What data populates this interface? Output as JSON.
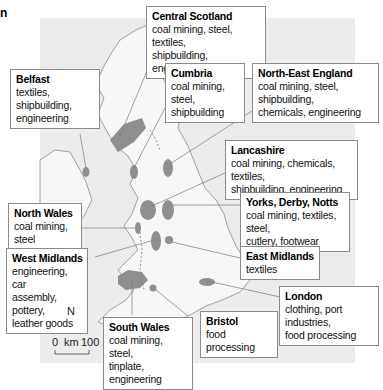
{
  "corner_text": "n",
  "regions": [
    {
      "id": "central-scotland",
      "title": "Central Scotland",
      "lines": [
        "coal mining, steel, textiles,",
        "shipbuilding, engineering"
      ]
    },
    {
      "id": "belfast",
      "title": "Belfast",
      "lines": [
        "textiles, shipbuilding,",
        "engineering"
      ]
    },
    {
      "id": "cumbria",
      "title": "Cumbria",
      "lines": [
        "coal mining, steel,",
        "shipbuilding"
      ]
    },
    {
      "id": "north-east-england",
      "title": "North-East England",
      "lines": [
        "coal mining, steel, shipbuilding,",
        "chemicals, engineering"
      ]
    },
    {
      "id": "lancashire",
      "title": "Lancashire",
      "lines": [
        "coal mining, chemicals, textiles,",
        "shipbuilding, engineering"
      ]
    },
    {
      "id": "north-wales",
      "title": "North Wales",
      "lines": [
        "coal mining, steel"
      ]
    },
    {
      "id": "yorks-derby-notts",
      "title": "Yorks, Derby, Notts",
      "lines": [
        "coal mining, textiles, steel,",
        "cutlery, footwear"
      ]
    },
    {
      "id": "west-midlands",
      "title": "West Midlands",
      "lines": [
        "engineering, car",
        "assembly, pottery,",
        "leather goods"
      ]
    },
    {
      "id": "east-midlands",
      "title": "East Midlands",
      "lines": [
        "textiles"
      ]
    },
    {
      "id": "london",
      "title": "London",
      "lines": [
        "clothing, port industries,",
        "food processing"
      ]
    },
    {
      "id": "bristol",
      "title": "Bristol",
      "lines": [
        "food processing"
      ]
    },
    {
      "id": "south-wales",
      "title": "South Wales",
      "lines": [
        "coal mining, steel,",
        "tinplate, engineering"
      ]
    }
  ],
  "compass": {
    "north_label": "N"
  },
  "scale_bar": {
    "start": "0",
    "unit": "km",
    "end": "100"
  },
  "colors": {
    "sea": "#ececec",
    "land": "#f7f7f7",
    "industrial_area": "#8f8f8f",
    "coast": "#8a8a8a"
  }
}
